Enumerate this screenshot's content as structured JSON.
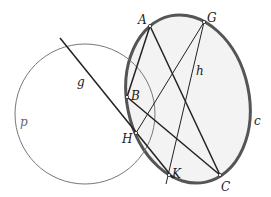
{
  "diagram": {
    "colors": {
      "circle_c": "#555555",
      "circle_c_fill": "#f3f3f3",
      "circle_p": "#777777",
      "segments": "#222222"
    },
    "points": [
      {
        "name": "A",
        "x": 150,
        "y": 26
      },
      {
        "name": "G",
        "x": 204,
        "y": 22
      },
      {
        "name": "B",
        "x": 127,
        "y": 97
      },
      {
        "name": "H",
        "x": 136,
        "y": 133
      },
      {
        "name": "K",
        "x": 169,
        "y": 175
      },
      {
        "name": "C",
        "x": 220,
        "y": 175
      }
    ],
    "labels": {
      "A": "A",
      "G": "G",
      "B": "B",
      "H": "H",
      "K": "K",
      "C": "C",
      "g": "g",
      "h": "h",
      "c": "c",
      "p": "p"
    },
    "curves": [
      {
        "name": "c",
        "type": "ellipse",
        "cx": 188,
        "cy": 99,
        "rx": 61,
        "ry": 85,
        "rotate": -12
      },
      {
        "name": "p",
        "type": "circle",
        "cx": 85,
        "cy": 114,
        "r": 70
      }
    ],
    "lines": [
      {
        "name": "g",
        "from": [
          60,
          38
        ],
        "to": [
          173,
          178
        ]
      },
      {
        "name": "h",
        "from": [
          204,
          22
        ],
        "to": [
          166,
          184
        ]
      }
    ],
    "segments": [
      [
        "A",
        "B"
      ],
      [
        "A",
        "C"
      ],
      [
        "B",
        "C"
      ],
      [
        "G",
        "H"
      ]
    ]
  }
}
